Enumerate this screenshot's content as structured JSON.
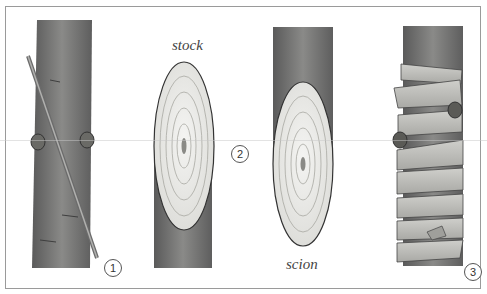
{
  "figure": {
    "labels": {
      "stock": "stock",
      "scion": "scion"
    },
    "steps": [
      {
        "number": "1",
        "description": "Stem with buds and diagonal cutting line"
      },
      {
        "number": "2",
        "description": "Cut stock and scion faces showing growth rings"
      },
      {
        "number": "3",
        "description": "Joined graft wrapped with binding tape"
      }
    ],
    "colors": {
      "bark": "#6f6f6f",
      "bark_dark": "#4f4f4f",
      "wood_face": "#ececea",
      "ring": "#a8a8a2",
      "tape": "#bdbdb9",
      "border": "#9a9a9a"
    }
  }
}
